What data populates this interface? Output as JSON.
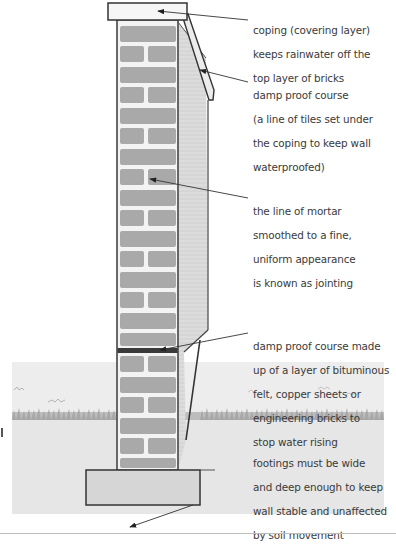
{
  "diagram": {
    "colors": {
      "brick": "#a9a9a9",
      "mortar": "#f4f4f4",
      "outline": "#444444",
      "side_face": "#dadada",
      "ground": "#ececec",
      "grass": "#9a9a9a",
      "footing": "#d6d6d6",
      "text": "#3a3a3a"
    },
    "labels": [
      {
        "id": "coping",
        "lines": [
          "coping (covering layer)",
          "keeps rainwater off the",
          "top layer of bricks"
        ]
      },
      {
        "id": "dpc-top",
        "lines": [
          "damp proof course",
          "(a line of tiles set under",
          "the coping to keep wall",
          "waterproofed)"
        ]
      },
      {
        "id": "jointing",
        "lines": [
          "the line of mortar",
          "smoothed to a fine,",
          "uniform appearance",
          "is known as jointing"
        ]
      },
      {
        "id": "dpc-bottom",
        "lines": [
          "damp proof course made",
          "up of a layer of bituminous",
          "felt, copper sheets or",
          "engineering bricks to",
          "stop water rising"
        ]
      },
      {
        "id": "footings",
        "lines": [
          "footings must be wide",
          "and deep enough to keep",
          "wall stable and unaffected",
          "by soil movement"
        ]
      }
    ],
    "parts": [
      "coping",
      "damp-proof-course-tiles",
      "brick-wall",
      "mortar-joints",
      "damp-proof-course-felt",
      "ground-level",
      "footing"
    ]
  }
}
